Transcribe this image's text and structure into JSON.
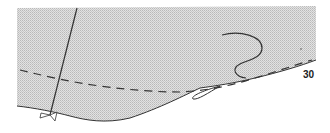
{
  "diagram": {
    "type": "sewing-pattern-piece-fragment",
    "piece_number_label": "30",
    "colors": {
      "fill_pattern_light": "#e2e2e2",
      "fill_pattern_dark": "#b9b9b9",
      "outline": "#333333",
      "background": "#ffffff"
    },
    "elements": [
      {
        "name": "pattern-piece",
        "kind": "shaded-region"
      },
      {
        "name": "grainline",
        "kind": "solid-line"
      },
      {
        "name": "seam-allowance-line",
        "kind": "dashed-line"
      },
      {
        "name": "curved-marking",
        "kind": "s-curve"
      },
      {
        "name": "notch",
        "kind": "triangle-markers"
      },
      {
        "name": "dart-tip",
        "kind": "small-hook"
      }
    ]
  }
}
